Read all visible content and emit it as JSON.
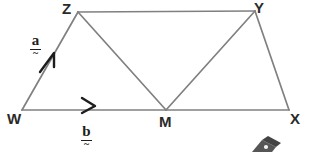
{
  "figure": {
    "name": "vector-parallelogram-diagram",
    "background_color": "#ffffff",
    "line_color": "#808080",
    "line_width": 1.6,
    "label_color": "#2a2a2a",
    "vector_label_color": "#1d1d1d",
    "width": 310,
    "height": 152
  },
  "points": {
    "W": {
      "label": "W",
      "x": 22,
      "y": 110,
      "label_x": 7,
      "label_y": 111
    },
    "X": {
      "label": "X",
      "x": 289,
      "y": 110,
      "label_x": 290,
      "label_y": 111
    },
    "M": {
      "label": "M",
      "x": 166,
      "y": 110,
      "label_x": 159,
      "label_y": 114
    },
    "Z": {
      "label": "Z",
      "x": 78,
      "y": 12,
      "label_x": 62,
      "label_y": 1
    },
    "Y": {
      "label": "Y",
      "x": 255,
      "y": 11,
      "label_x": 254,
      "label_y": 0
    }
  },
  "segments": [
    {
      "name": "segment-WZ",
      "from": "W",
      "to": "Z"
    },
    {
      "name": "segment-ZY",
      "from": "Z",
      "to": "Y"
    },
    {
      "name": "segment-YX",
      "from": "Y",
      "to": "X"
    },
    {
      "name": "segment-WX",
      "from": "W",
      "to": "X"
    },
    {
      "name": "segment-ZM",
      "from": "Z",
      "to": "M"
    },
    {
      "name": "segment-MY",
      "from": "M",
      "to": "Y"
    }
  ],
  "vectors": [
    {
      "name": "vector-a",
      "label": "a",
      "tilde": "~",
      "on_segment": "segment-WZ",
      "direction": "W-to-Z",
      "label_x": 30,
      "label_y": 33,
      "arrow_x": 50,
      "arrow_y": 60
    },
    {
      "name": "vector-b",
      "label": "b",
      "tilde": "~",
      "on_segment": "segment-WM",
      "direction": "W-to-M",
      "label_x": 81,
      "label_y": 124,
      "arrow_x": 88,
      "arrow_y": 104
    }
  ],
  "corner_watermark": {
    "name": "corner-watermark",
    "visible": true,
    "color": "#3a3a3a",
    "description": "partially cropped dark shape at bottom-right edge"
  }
}
